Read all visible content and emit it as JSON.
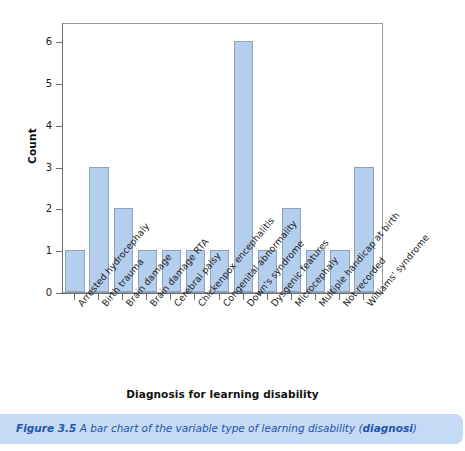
{
  "chart_data": {
    "type": "bar",
    "title": "",
    "xlabel": "Diagnosis for learning disability",
    "ylabel": "Count",
    "ylim": [
      0,
      6
    ],
    "yticks": [
      "0",
      "1",
      "2",
      "3",
      "4",
      "5",
      "6"
    ],
    "grid": false,
    "legend": false,
    "bar_color": "#b4cfee",
    "bar_border_color": "#8ba3bd",
    "categories": [
      "Arrested hydrocephaly",
      "Birth trauma",
      "Brain damage",
      "Brain damage RTA",
      "Cerebral palsy",
      "Chickenpox encephalitis",
      "Congenital abnormality",
      "Down's syndrome",
      "Dysgenic features",
      "Microcephaly",
      "Multiple handicap at birth",
      "Not recorded",
      "Williams' syndrome"
    ],
    "values": [
      1,
      3,
      2,
      1,
      1,
      1,
      1,
      6,
      1,
      2,
      1,
      1,
      3
    ]
  },
  "caption": {
    "figure_number": "Figure 3.5",
    "text": "A bar chart of the variable type of learning disability (",
    "variable": "diagnosi",
    "text_end": ")"
  }
}
